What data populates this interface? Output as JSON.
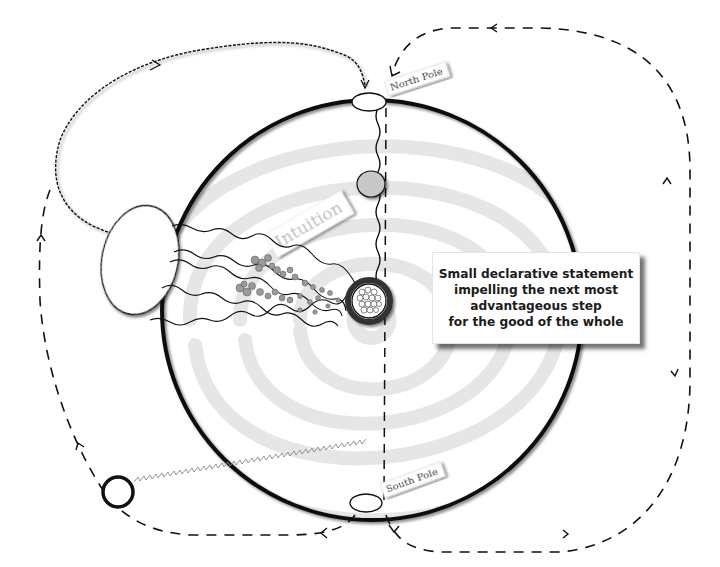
{
  "labels": {
    "north_pole": "North Pole",
    "south_pole": "South Pole",
    "intuition": "Intuition"
  },
  "statement": {
    "lines": [
      "Small declarative statement",
      "impelling the next most",
      "advantageous step",
      "for the good of the whole"
    ]
  },
  "colors": {
    "ink": "#111111",
    "swirl": "#e6e6e6",
    "node_fill": "#c8c8c8",
    "cluster": "#8f8f8f",
    "background": "#ffffff"
  }
}
